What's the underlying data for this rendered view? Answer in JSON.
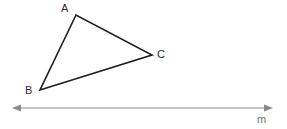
{
  "figure": {
    "background_color": "#ffffff",
    "width": 287,
    "height": 129,
    "triangle": {
      "name": "triangle-ABC",
      "stroke_color": "#1c1c1c",
      "stroke_width": 1.6,
      "fill": "none",
      "vertices": [
        {
          "label": "A",
          "x": 76,
          "y": 15,
          "label_x": 61,
          "label_y": 3
        },
        {
          "label": "B",
          "x": 40,
          "y": 90,
          "label_x": 25,
          "label_y": 85
        },
        {
          "label": "C",
          "x": 152,
          "y": 55,
          "label_x": 157,
          "label_y": 49
        }
      ],
      "edges": [
        "AB",
        "BC",
        "CA"
      ]
    },
    "line": {
      "label": "m",
      "stroke_color": "#8a8a8a",
      "stroke_width": 1.2,
      "arrowheads": "both",
      "x_start": 12,
      "x_end": 272,
      "y": 108,
      "label_x": 257,
      "label_y": 114
    }
  }
}
